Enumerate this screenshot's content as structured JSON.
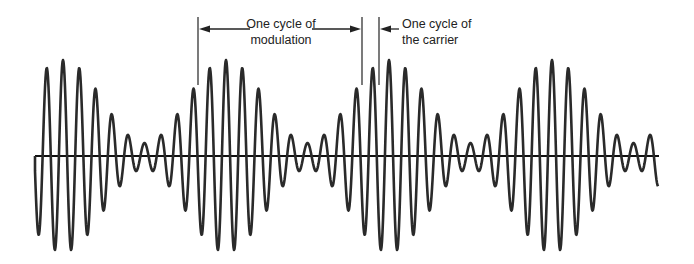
{
  "diagram": {
    "labels": {
      "modulation_line1": "One cycle of",
      "modulation_line2": "modulation",
      "carrier_line1": "One cycle of",
      "carrier_line2": "the carrier"
    },
    "colors": {
      "wave": "#2a2a2a",
      "axis": "#111111",
      "text": "#222222"
    },
    "axis": {
      "x_start": 35,
      "x_end": 659,
      "y": 156
    },
    "wave": {
      "x_start": 35,
      "x_end": 658,
      "carrier_period_px": 16.3,
      "modulation_period_px": 163,
      "envelope_peak_x": 63,
      "amplitude_mean": 54.5,
      "amplitude_variation": 41.5
    },
    "markers": {
      "modulation_left_x": 198,
      "modulation_right_x": 362,
      "carrier_x": 379,
      "top_y": 17,
      "bottom_y": 85,
      "arrow_y": 29
    }
  }
}
